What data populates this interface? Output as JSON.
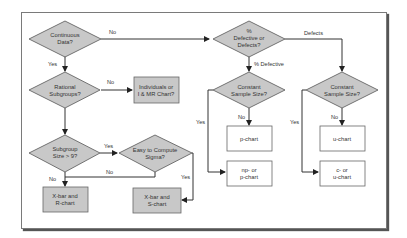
{
  "diagram": {
    "type": "flowchart",
    "decisions": {
      "continuous": [
        "Continuous",
        "Data?"
      ],
      "rational": [
        "Rational",
        "Subgroups?"
      ],
      "subgroup": [
        "Subgroup",
        "Size > 9?"
      ],
      "sigma": [
        "Easy to Compute",
        "Sigma?"
      ],
      "defective": [
        "%",
        "Defective or",
        "Defects?"
      ],
      "const_p": [
        "Constant",
        "Sample Size?"
      ],
      "const_u": [
        "Constant",
        "Sample Size?"
      ]
    },
    "outcomes": {
      "imr": [
        "Individuals or",
        "I & MR Chart?"
      ],
      "xr": [
        "X-bar and",
        "R-chart"
      ],
      "xs": [
        "X-bar and",
        "S-chart"
      ],
      "p": [
        "p-chart"
      ],
      "np": [
        "np- or",
        "p-chart"
      ],
      "u": [
        "u-chart"
      ],
      "cu": [
        "c- or",
        "u-chart"
      ]
    },
    "edge_labels": {
      "continuous_no": "No",
      "continuous_yes": "Yes",
      "rational_no": "No",
      "subgroup_yes": "Yes",
      "subgroup_no": "No",
      "sigma_no": "No",
      "sigma_yes": "Yes",
      "defects": "Defects",
      "pct_defective": "% Defective",
      "const_p_no": "No",
      "const_p_yes": "Yes",
      "const_u_no": "No",
      "const_u_yes": "Yes"
    },
    "colors": {
      "shaded_fill": "#c8c8c8",
      "line": "#333333",
      "outcome_plain_fill": "#ffffff"
    }
  }
}
